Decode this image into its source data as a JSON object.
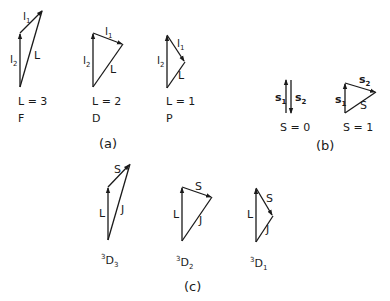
{
  "panels": {
    "a": {
      "caption": "(a)",
      "diagrams": [
        {
          "id": "F",
          "l1": "l",
          "l1_sub": "1",
          "l2": "l",
          "l2_sub": "2",
          "resultant": "L",
          "value": "L = 3",
          "term": "F"
        },
        {
          "id": "D",
          "l1": "l",
          "l1_sub": "1",
          "l2": "l",
          "l2_sub": "2",
          "resultant": "L",
          "value": "L = 2",
          "term": "D"
        },
        {
          "id": "P",
          "l1": "l",
          "l1_sub": "1",
          "l2": "l",
          "l2_sub": "2",
          "resultant": "L",
          "value": "L = 1",
          "term": "P"
        }
      ]
    },
    "b": {
      "caption": "(b)",
      "diagrams": [
        {
          "id": "S0",
          "s1": "s",
          "s1_sub": "1",
          "s2": "s",
          "s2_sub": "2",
          "value": "S = 0"
        },
        {
          "id": "S1",
          "s1": "s",
          "s1_sub": "1",
          "s2": "s",
          "s2_sub": "2",
          "resultant": "S",
          "value": "S = 1"
        }
      ]
    },
    "c": {
      "caption": "(c)",
      "diagrams": [
        {
          "id": "3D3",
          "L": "L",
          "S": "S",
          "J": "J",
          "sup": "3",
          "term": "D",
          "sub": "3"
        },
        {
          "id": "3D2",
          "L": "L",
          "S": "S",
          "J": "J",
          "sup": "3",
          "term": "D",
          "sub": "2"
        },
        {
          "id": "3D1",
          "L": "L",
          "S": "S",
          "J": "J",
          "sup": "3",
          "term": "D",
          "sub": "1"
        }
      ]
    }
  },
  "colors": {
    "line": "#1a1a1a",
    "background": "#ffffff"
  }
}
